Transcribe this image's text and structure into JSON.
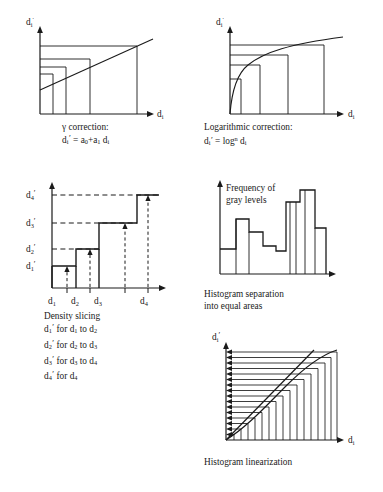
{
  "figure": {
    "background_color": "#ffffff",
    "line_color": "#1a1a1a"
  },
  "panels": [
    {
      "id": "gamma",
      "name": "gamma-correction-panel",
      "y_axis_label": "di'",
      "x_axis_label": "di",
      "curve_type": "line",
      "caption_lines": [
        "γ correction:",
        "di' = a0+a1 di"
      ],
      "caption_line1": "γ correction:",
      "vertical_dividers": 4,
      "horizontal_levels": 5
    },
    {
      "id": "log",
      "name": "logarithmic-correction-panel",
      "y_axis_label": "di'",
      "x_axis_label": "di",
      "curve_type": "logarithmic",
      "caption_lines": [
        "Logarithmic correction:",
        "di' = log^n di"
      ],
      "caption_line1": "Logarithmic correction:",
      "vertical_dividers": 4,
      "horizontal_levels": 5
    },
    {
      "id": "density",
      "name": "density-slicing-panel",
      "y_tick_labels": [
        "d4'",
        "d3'",
        "d2'",
        "d1'"
      ],
      "x_tick_labels": [
        "d1",
        "d2",
        "d3",
        "d4"
      ],
      "curve_type": "step",
      "caption_lines": [
        "Density slicing",
        "d1' for d1 to d2",
        "d2' for d2 to d3",
        "d3' for d3 to d4",
        "d4' for d4"
      ],
      "caption_title": "Density slicing",
      "steps": 4
    },
    {
      "id": "histogram",
      "name": "histogram-separation-panel",
      "y_axis_label_line1": "Frequency of",
      "y_axis_label_line2": "gray levels",
      "curve_type": "histogram",
      "caption_lines": [
        "Histogram separation",
        "into equal areas"
      ],
      "bar_values": [
        30,
        30,
        66,
        66,
        47,
        47,
        30,
        30,
        20,
        20,
        77,
        77,
        100,
        100,
        100,
        47,
        47
      ],
      "equal_area_dividers": 6
    },
    {
      "id": "linearization",
      "name": "histogram-linearization-panel",
      "y_axis_label": "di'",
      "x_axis_label": "di",
      "curve_type": "dual-line",
      "caption_lines": [
        "Histogram linearization"
      ],
      "caption_title": "Histogram linearization",
      "arrow_rows": 16
    }
  ]
}
